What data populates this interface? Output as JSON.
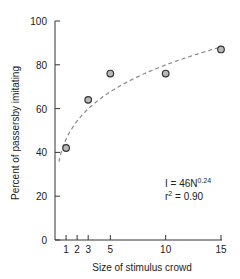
{
  "chart_data": {
    "type": "scatter",
    "title": "",
    "xlabel": "Size of stimulus crowd",
    "ylabel": "Percent of passersby imitating",
    "xlim": [
      0,
      15
    ],
    "ylim": [
      0,
      100
    ],
    "x_ticks": [
      1,
      2,
      3,
      5,
      10,
      15
    ],
    "y_ticks": [
      0,
      20,
      40,
      60,
      80,
      100
    ],
    "grid": false,
    "legend": null,
    "series": [
      {
        "name": "Observed",
        "marker": "open-circle",
        "x": [
          1,
          3,
          5,
          10,
          15
        ],
        "y": [
          42,
          64,
          76,
          76,
          87
        ]
      },
      {
        "name": "Fit I = 46N^0.24",
        "style": "dashed",
        "equation": "I = 46N^0.24",
        "x": [
          0.5,
          1,
          2,
          3,
          5,
          7,
          10,
          12,
          15
        ],
        "y": [
          34,
          46,
          54,
          60,
          67,
          73,
          80,
          84,
          88
        ]
      }
    ],
    "annotations": [
      "I = 46N0.24",
      "r2 = 0.90"
    ]
  },
  "labels": {
    "xlabel": "Size of stimulus crowd",
    "ylabel": "Percent of passersby imitating",
    "eq_main": "I = 46N",
    "eq_exp": "0.24",
    "r_main": "r",
    "r_exp": "2",
    "r_val": " = 0.90",
    "y_ticks": [
      "0",
      "20",
      "40",
      "60",
      "80",
      "100"
    ],
    "x_ticks": [
      "1",
      "2",
      "3",
      "5",
      "10",
      "15"
    ]
  },
  "colors": {
    "axis": "#333333",
    "marker_fill": "#b8b8b8",
    "marker_stroke": "#333333",
    "fit_line": "#8a8a8a"
  }
}
